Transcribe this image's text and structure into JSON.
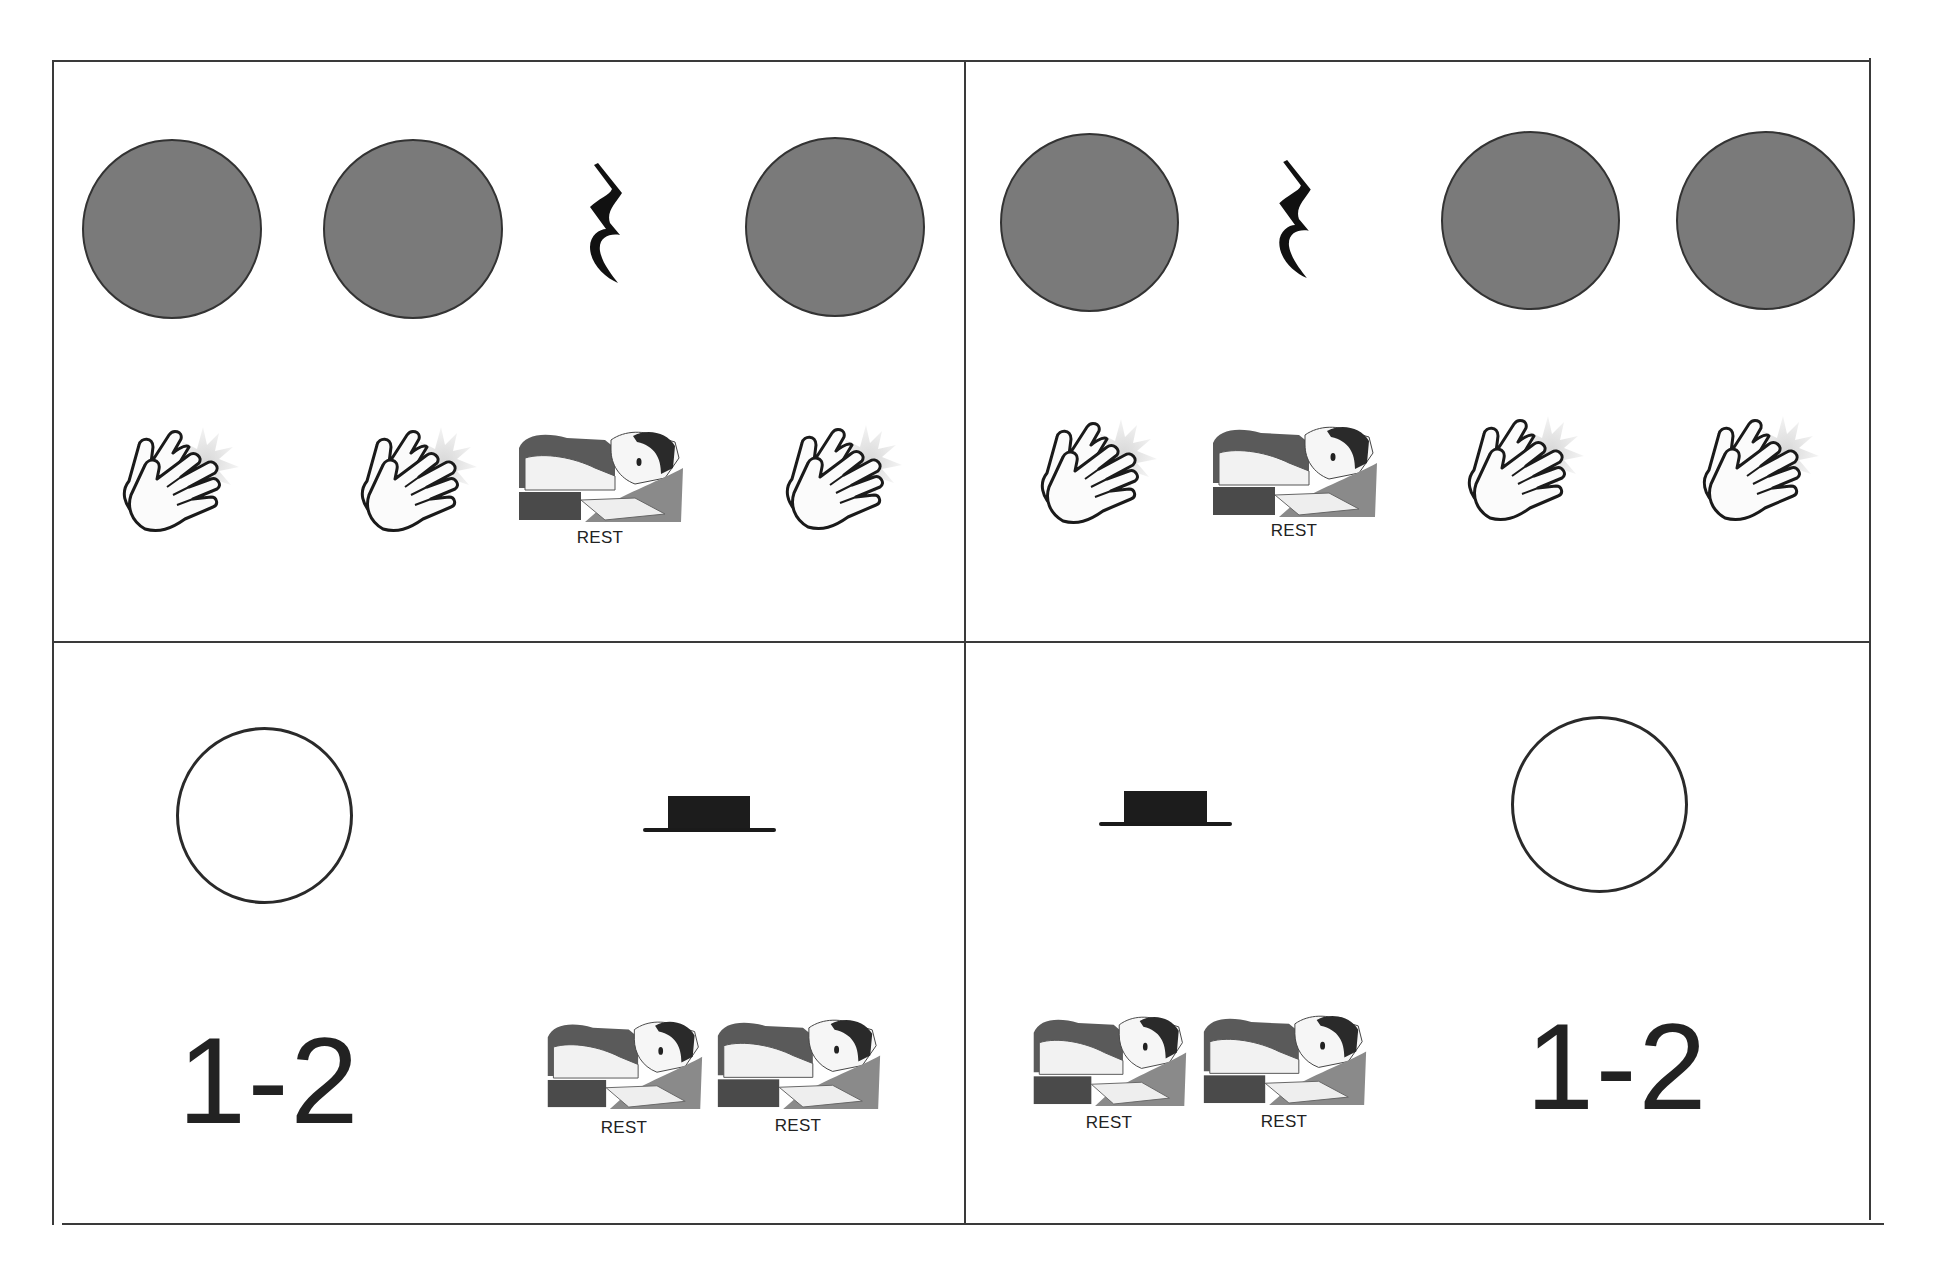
{
  "worksheet": {
    "panels": [
      {
        "id": "top-left",
        "notes": [
          "quarter",
          "quarter",
          "quarter-rest",
          "quarter"
        ],
        "actions": [
          "clap",
          "clap",
          "rest",
          "clap"
        ]
      },
      {
        "id": "top-right",
        "notes": [
          "quarter",
          "quarter-rest",
          "quarter",
          "quarter"
        ],
        "actions": [
          "clap",
          "rest",
          "clap",
          "clap"
        ]
      },
      {
        "id": "bottom-left",
        "notes": [
          "half-note",
          "half-rest"
        ],
        "count_label": "1-2",
        "actions": [
          "rest",
          "rest"
        ]
      },
      {
        "id": "bottom-right",
        "notes": [
          "half-rest",
          "half-note"
        ],
        "count_label": "1-2",
        "actions": [
          "rest",
          "rest"
        ]
      }
    ],
    "rest_label": "REST",
    "icons": {
      "clap": "clapping-hands-icon",
      "rest": "sleeping-child-icon",
      "quarter_rest": "quarter-rest-icon",
      "half_rest": "half-rest-icon"
    },
    "colors": {
      "filled_note": "#7a7a7a",
      "outline": "#2a2a2a",
      "frame": "#3a3a3a"
    }
  }
}
